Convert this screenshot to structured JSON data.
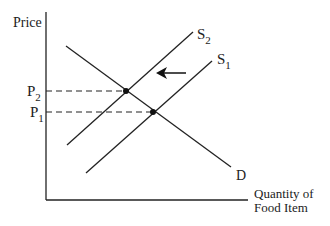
{
  "diagram": {
    "y_axis_label": "Price",
    "x_axis_label_line1": "Quantity of",
    "x_axis_label_line2": "Food Item",
    "curves": {
      "demand": {
        "label": "D"
      },
      "supply_original": {
        "label": "S",
        "subscript": "1"
      },
      "supply_new": {
        "label": "S",
        "subscript": "2"
      }
    },
    "price_levels": {
      "p2": {
        "label": "P",
        "subscript": "2"
      },
      "p1": {
        "label": "P",
        "subscript": "1"
      }
    },
    "shift_arrow": {
      "direction": "left"
    },
    "colors": {
      "line": "#222222",
      "background": "#ffffff"
    }
  }
}
